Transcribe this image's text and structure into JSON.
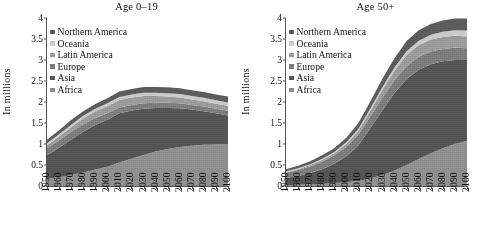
{
  "figure": {
    "ylabel": "In millions",
    "panels": [
      "age_0_19",
      "age_50_plus"
    ]
  },
  "legend": {
    "items": [
      {
        "label": "Northern America",
        "color": "#5b5b5b"
      },
      {
        "label": "Oceania",
        "color": "#c9c9c9"
      },
      {
        "label": "Latin America",
        "color": "#9a9a9a"
      },
      {
        "label": "Europe",
        "color": "#7b7b7b"
      },
      {
        "label": "Asia",
        "color": "#545454"
      },
      {
        "label": "Africa",
        "color": "#8e8e8e"
      }
    ]
  },
  "axis": {
    "y_ticks": [
      "0",
      "0.5",
      "1",
      "1.5",
      "2",
      "2.5",
      "3",
      "3.5",
      "4"
    ],
    "x_ticks": [
      "1950",
      "1960",
      "1970",
      "1980",
      "1990",
      "2000",
      "2010",
      "2020",
      "2030",
      "2040",
      "2050",
      "2060",
      "2070",
      "2080",
      "2090",
      "2100"
    ]
  },
  "chart_data": [
    {
      "type": "area",
      "id": "age_0_19",
      "title": "Age 0–19",
      "stacked": true,
      "xlabel": "",
      "ylabel": "In millions",
      "ylim": [
        0,
        4
      ],
      "xlim": [
        "1950",
        "2100"
      ],
      "grid": false,
      "legend_position": "upper-left",
      "x": [
        "1950",
        "1960",
        "1970",
        "1980",
        "1990",
        "2000",
        "2010",
        "2020",
        "2030",
        "2040",
        "2050",
        "2060",
        "2070",
        "2080",
        "2090",
        "2100"
      ],
      "series": [
        {
          "name": "Africa",
          "color": "#8e8e8e",
          "values": [
            0.17,
            0.21,
            0.26,
            0.32,
            0.39,
            0.46,
            0.56,
            0.65,
            0.74,
            0.82,
            0.88,
            0.93,
            0.96,
            0.98,
            0.99,
            1.0
          ]
        },
        {
          "name": "Asia",
          "color": "#545454",
          "values": [
            0.56,
            0.7,
            0.85,
            0.97,
            1.06,
            1.12,
            1.17,
            1.15,
            1.1,
            1.04,
            0.98,
            0.92,
            0.86,
            0.8,
            0.74,
            0.68
          ]
        },
        {
          "name": "Europe",
          "color": "#7b7b7b",
          "values": [
            0.17,
            0.18,
            0.18,
            0.18,
            0.17,
            0.15,
            0.14,
            0.13,
            0.13,
            0.12,
            0.12,
            0.12,
            0.11,
            0.11,
            0.11,
            0.11
          ]
        },
        {
          "name": "Latin America",
          "color": "#9a9a9a",
          "values": [
            0.07,
            0.09,
            0.11,
            0.14,
            0.16,
            0.17,
            0.18,
            0.18,
            0.17,
            0.16,
            0.15,
            0.14,
            0.13,
            0.13,
            0.12,
            0.12
          ]
        },
        {
          "name": "Oceania",
          "color": "#c9c9c9",
          "values": [
            0.05,
            0.05,
            0.06,
            0.06,
            0.06,
            0.07,
            0.07,
            0.07,
            0.08,
            0.08,
            0.08,
            0.08,
            0.08,
            0.08,
            0.08,
            0.08
          ]
        },
        {
          "name": "Northern America",
          "color": "#5b5b5b",
          "values": [
            0.08,
            0.1,
            0.11,
            0.11,
            0.11,
            0.12,
            0.13,
            0.13,
            0.14,
            0.14,
            0.14,
            0.14,
            0.14,
            0.14,
            0.14,
            0.14
          ]
        }
      ],
      "totals": [
        1.1,
        1.33,
        1.57,
        1.78,
        1.95,
        2.09,
        2.25,
        2.31,
        2.36,
        2.36,
        2.35,
        2.33,
        2.28,
        2.24,
        2.18,
        2.13
      ]
    },
    {
      "type": "area",
      "id": "age_50_plus",
      "title": "Age 50+",
      "stacked": true,
      "xlabel": "",
      "ylabel": "In millions",
      "ylim": [
        0,
        4
      ],
      "xlim": [
        "1950",
        "2100"
      ],
      "grid": false,
      "legend_position": "upper-left",
      "x": [
        "1950",
        "1960",
        "1970",
        "1980",
        "1990",
        "2000",
        "2010",
        "2020",
        "2030",
        "2040",
        "2050",
        "2060",
        "2070",
        "2080",
        "2090",
        "2100"
      ],
      "series": [
        {
          "name": "Africa",
          "color": "#8e8e8e",
          "values": [
            0.02,
            0.03,
            0.04,
            0.05,
            0.07,
            0.09,
            0.12,
            0.18,
            0.26,
            0.37,
            0.5,
            0.64,
            0.78,
            0.9,
            1.0,
            1.08
          ]
        },
        {
          "name": "Asia",
          "color": "#545454",
          "values": [
            0.17,
            0.21,
            0.27,
            0.35,
            0.46,
            0.62,
            0.85,
            1.2,
            1.55,
            1.85,
            2.05,
            2.13,
            2.12,
            2.07,
            2.0,
            1.92
          ]
        },
        {
          "name": "Europe",
          "color": "#7b7b7b",
          "values": [
            0.12,
            0.14,
            0.16,
            0.18,
            0.2,
            0.22,
            0.25,
            0.28,
            0.3,
            0.31,
            0.31,
            0.31,
            0.3,
            0.29,
            0.29,
            0.28
          ]
        },
        {
          "name": "Latin America",
          "color": "#9a9a9a",
          "values": [
            0.02,
            0.02,
            0.03,
            0.04,
            0.05,
            0.07,
            0.09,
            0.13,
            0.18,
            0.22,
            0.26,
            0.28,
            0.29,
            0.29,
            0.29,
            0.28
          ]
        },
        {
          "name": "Oceania",
          "color": "#c9c9c9",
          "values": [
            0.02,
            0.02,
            0.02,
            0.03,
            0.03,
            0.04,
            0.05,
            0.06,
            0.07,
            0.08,
            0.09,
            0.1,
            0.11,
            0.12,
            0.13,
            0.14
          ]
        },
        {
          "name": "Northern America",
          "color": "#5b5b5b",
          "values": [
            0.05,
            0.06,
            0.07,
            0.08,
            0.09,
            0.11,
            0.14,
            0.17,
            0.2,
            0.22,
            0.24,
            0.25,
            0.26,
            0.27,
            0.28,
            0.29
          ]
        }
      ],
      "totals": [
        0.4,
        0.48,
        0.59,
        0.73,
        0.9,
        1.15,
        1.5,
        2.02,
        2.56,
        3.05,
        3.45,
        3.71,
        3.86,
        3.94,
        3.99,
        3.99
      ]
    }
  ]
}
